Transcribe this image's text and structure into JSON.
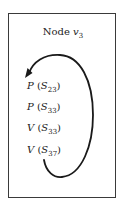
{
  "node": {
    "prefix": "Node",
    "var": "v",
    "sub": "3"
  },
  "items": [
    {
      "fn": "P",
      "var": "S",
      "sub": "23"
    },
    {
      "fn": "P",
      "var": "S",
      "sub": "33"
    },
    {
      "fn": "V",
      "var": "S",
      "sub": "33"
    },
    {
      "fn": "V",
      "var": "S",
      "sub": "37"
    }
  ],
  "arrow": {
    "from": "V(S37)",
    "to": "P(S23)",
    "direction": "clockwise loop from bottom to top",
    "color": "#1a1a1a"
  },
  "colors": {
    "border": "#3a3a3a",
    "text": "#222222"
  }
}
